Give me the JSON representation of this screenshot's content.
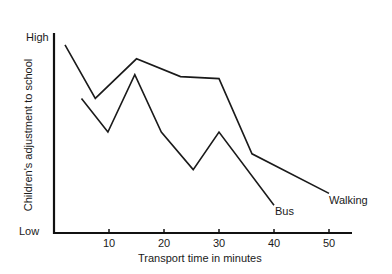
{
  "chart_data": {
    "type": "line",
    "title": "",
    "xlabel": "Transport time in minutes",
    "ylabel": "Children's adjustment to school",
    "x_ticks": [
      10,
      20,
      30,
      40,
      50
    ],
    "xlim": [
      0,
      55
    ],
    "y_ticks_labels": {
      "low": "Low",
      "high": "High"
    },
    "ylim": [
      0,
      10
    ],
    "grid": false,
    "legend": "inline labels at line ends",
    "series": [
      {
        "name": "Walking",
        "x": [
          2,
          7.5,
          15,
          23,
          30,
          36,
          50
        ],
        "y": [
          9.5,
          6.8,
          8.8,
          7.9,
          7.8,
          4.0,
          2.0
        ]
      },
      {
        "name": "Bus",
        "x": [
          5,
          9.8,
          14.7,
          19.5,
          25.3,
          30,
          40
        ],
        "y": [
          6.8,
          5.1,
          8.0,
          5.1,
          3.2,
          5.1,
          1.4
        ]
      }
    ]
  },
  "labels": {
    "high": "High",
    "low": "Low",
    "ylabel": "Children's adjustment to school",
    "xlabel": "Transport time in minutes",
    "ticks": [
      "10",
      "20",
      "30",
      "40",
      "50"
    ],
    "walking": "Walking",
    "bus": "Bus"
  }
}
